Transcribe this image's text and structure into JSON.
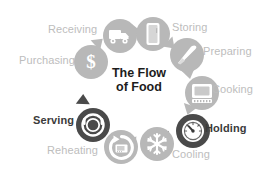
{
  "diagram": {
    "title_line1": "The Flow",
    "title_line2": "of Food",
    "background_color": "#ffffff",
    "accent_light": "#b8b8b8",
    "accent_dark": "#4a4a4a",
    "label_light_color": "#bdbdbd",
    "label_dark_color": "#3b3b3b",
    "flow_direction": "clockwise",
    "steps": [
      {
        "label": "Purchasing",
        "icon": "dollar-sign-icon",
        "emphasis": "light"
      },
      {
        "label": "Receiving",
        "icon": "delivery-truck-icon",
        "emphasis": "light"
      },
      {
        "label": "Storing",
        "icon": "refrigerator-icon",
        "emphasis": "light"
      },
      {
        "label": "Preparing",
        "icon": "knife-icon",
        "emphasis": "light"
      },
      {
        "label": "Cooking",
        "icon": "oven-icon",
        "emphasis": "light"
      },
      {
        "label": "Holding",
        "icon": "thermometer-gauge-icon",
        "emphasis": "dark"
      },
      {
        "label": "Cooling",
        "icon": "snowflake-icon",
        "emphasis": "light"
      },
      {
        "label": "Reheating",
        "icon": "microwave-reheat-icon",
        "emphasis": "light"
      },
      {
        "label": "Serving",
        "icon": "covered-plate-icon",
        "emphasis": "dark"
      }
    ]
  }
}
